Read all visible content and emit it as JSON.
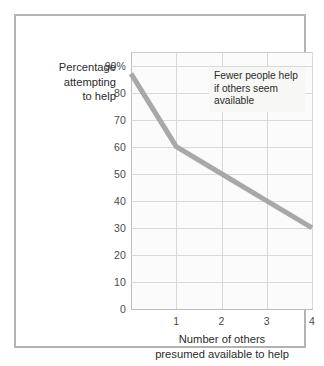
{
  "figure": {
    "frame_color": "#b3b3b3",
    "plot_background": "#fbfbfb",
    "grid_color": "#d9d9d9",
    "line_color": "#a8a8a8"
  },
  "annotation": {
    "line1": "Fewer people help",
    "line2": "if others seem",
    "line3": "available"
  },
  "axis": {
    "ylabel_line1": "Percentage",
    "ylabel_line2": "attempting",
    "ylabel_line3": "to help",
    "xlabel_line1": "Number of others",
    "xlabel_line2": "presumed available to help"
  },
  "chart_data": {
    "type": "line",
    "title": "",
    "xlabel": "Number of others presumed available to help",
    "ylabel": "Percentage attempting to help",
    "x": [
      0,
      1,
      2,
      3,
      4
    ],
    "values": [
      87,
      60,
      50,
      40,
      30
    ],
    "series": [
      {
        "name": "Percentage attempting to help",
        "values": [
          87,
          60,
          50,
          40,
          30
        ],
        "color": "#a8a8a8"
      }
    ],
    "xlim": [
      0,
      4
    ],
    "ylim": [
      0,
      95
    ],
    "xticks": [
      1,
      2,
      3,
      4
    ],
    "xticklabels": [
      "1",
      "2",
      "3",
      "4"
    ],
    "yticks": [
      0,
      10,
      20,
      30,
      40,
      50,
      60,
      70,
      80,
      90
    ],
    "yticklabels": [
      "0",
      "10",
      "20",
      "30",
      "40",
      "50",
      "60",
      "70",
      "80",
      "90%"
    ],
    "grid": true,
    "legend": false,
    "annotations": [
      "Fewer people help if others seem available"
    ]
  }
}
